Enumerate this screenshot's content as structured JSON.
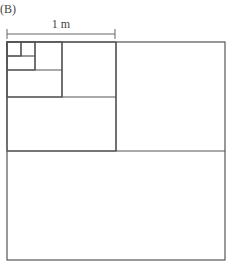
{
  "figure": {
    "panel_label": "(B)",
    "scale_bar": {
      "label": "1 m",
      "x1": 7,
      "x2": 115,
      "y": 34
    },
    "colors": {
      "line": "#555555",
      "background": "#ffffff"
    },
    "squares": [
      {
        "name": "outer-square",
        "x": 7,
        "y": 42,
        "size": 218
      },
      {
        "name": "square-level-1",
        "x": 7,
        "y": 42,
        "size": 109
      },
      {
        "name": "square-level-2",
        "x": 7,
        "y": 42,
        "size": 55
      },
      {
        "name": "square-level-3",
        "x": 7,
        "y": 42,
        "size": 28
      },
      {
        "name": "square-level-4",
        "x": 7,
        "y": 42,
        "size": 14
      }
    ]
  }
}
